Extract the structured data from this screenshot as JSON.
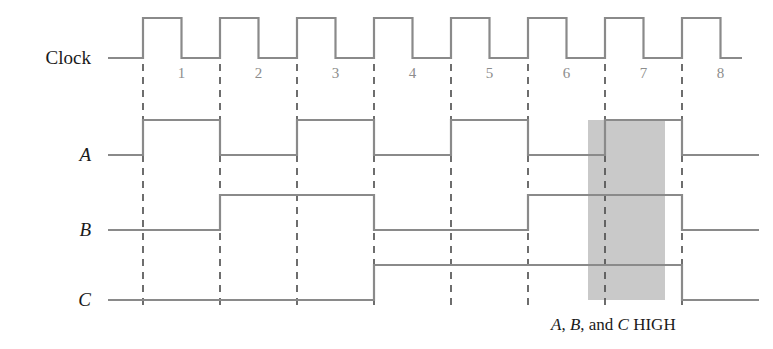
{
  "figure": {
    "type": "timing-diagram",
    "title": "",
    "background_color": "#ffffff",
    "wave_color": "#8a8a8a",
    "dash_color": "#4a4a4a",
    "shade_color": "#c9c9c9",
    "label_color": "#1a1a1a",
    "cycle_number_color": "#8d8d8d"
  },
  "signals": {
    "clock": {
      "label": "Clock",
      "italic": false,
      "high_y": 18,
      "low_y": 58
    },
    "a": {
      "label": "A",
      "italic": true,
      "high_y": 120,
      "low_y": 155
    },
    "b": {
      "label": "B",
      "italic": true,
      "high_y": 195,
      "low_y": 230
    },
    "c": {
      "label": "C",
      "italic": true,
      "high_y": 265,
      "low_y": 300
    }
  },
  "cycles": {
    "count": 8,
    "numbers": [
      "1",
      "2",
      "3",
      "4",
      "5",
      "6",
      "7",
      "8"
    ],
    "number_y": 78,
    "first_edge_x": 143,
    "period": 77,
    "lead_in_x": 108,
    "trail_out_x": 742
  },
  "annotation": {
    "text_parts": [
      {
        "text": "A",
        "italic": true
      },
      {
        "text": ", ",
        "italic": false
      },
      {
        "text": "B",
        "italic": true
      },
      {
        "text": ", and ",
        "italic": false
      },
      {
        "text": "C",
        "italic": true
      },
      {
        "text": " HIGH",
        "italic": false
      }
    ],
    "full_text": "A, B, and C HIGH",
    "x": 551,
    "y": 330
  },
  "highlight": {
    "label": "all-high-region",
    "cycle": 7,
    "x_start": 588,
    "x_end": 665,
    "y_top": 120,
    "y_bottom": 300
  },
  "chart_data": {
    "type": "line",
    "xlabel": "Clock cycle",
    "ylabel": "Logic level",
    "x": [
      1,
      2,
      3,
      4,
      5,
      6,
      7,
      8
    ],
    "categories": [
      "1",
      "2",
      "3",
      "4",
      "5",
      "6",
      "7",
      "8"
    ],
    "series": [
      {
        "name": "Clock",
        "values": [
          1,
          1,
          1,
          1,
          1,
          1,
          1,
          1
        ],
        "note": "square wave, one pulse per cycle"
      },
      {
        "name": "A",
        "values": [
          1,
          0,
          1,
          0,
          1,
          0,
          1,
          0
        ]
      },
      {
        "name": "B",
        "values": [
          0,
          1,
          1,
          0,
          0,
          1,
          1,
          0
        ]
      },
      {
        "name": "C",
        "values": [
          0,
          0,
          0,
          1,
          1,
          1,
          1,
          0
        ]
      }
    ],
    "annotations": [
      {
        "text": "A, B, and C HIGH",
        "cycle": 7
      }
    ],
    "grid": false,
    "legend": "left-axis-labels"
  }
}
